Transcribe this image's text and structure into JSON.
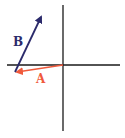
{
  "diagram": {
    "type": "vector-addition",
    "axes": {
      "color": "#1a1a1a",
      "origin": [
        63,
        65
      ],
      "horizontal": {
        "x1": 7,
        "x2": 120,
        "y": 65
      },
      "vertical": {
        "x": 63,
        "y1": 5,
        "y2": 131
      }
    },
    "vectors": [
      {
        "name": "A",
        "label": "A",
        "color": "#f05a3c",
        "from": [
          63,
          65
        ],
        "to": [
          15,
          72
        ],
        "label_pos": [
          36,
          83
        ]
      },
      {
        "name": "B",
        "label": "B",
        "color": "#2b2a6b",
        "from": [
          15,
          72
        ],
        "to": [
          43,
          13
        ],
        "label_pos": [
          13,
          46
        ]
      }
    ]
  }
}
